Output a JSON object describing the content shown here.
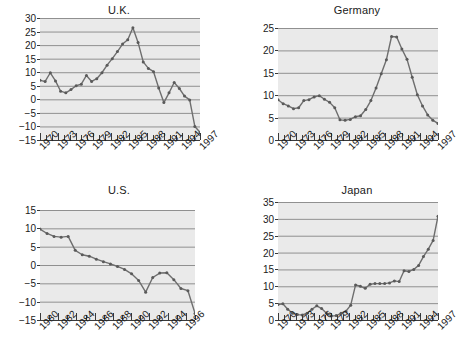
{
  "figure": {
    "panels_order": [
      "uk",
      "germany",
      "us",
      "japan"
    ]
  },
  "chart_data": [
    {
      "id": "uk",
      "type": "line",
      "title": "U.K.",
      "xlabel": "",
      "ylabel": "",
      "xlim": [
        1970,
        1997
      ],
      "ylim": [
        -15,
        30
      ],
      "yticks": [
        30,
        25,
        20,
        15,
        10,
        5,
        0,
        -5,
        -10,
        -15
      ],
      "xticks": [
        1970,
        1971,
        1972,
        1973,
        1974,
        1975,
        1976,
        1977,
        1978,
        1979,
        1980,
        1981,
        1982,
        1983,
        1984,
        1985,
        1986,
        1987,
        1988,
        1989,
        1990,
        1991,
        1992,
        1993,
        1994,
        1995,
        1996,
        1997
      ],
      "xticklabels": [
        "1970",
        "1973",
        "1976",
        "1979",
        "1982",
        "1985",
        "1988",
        "1991",
        "1994",
        "1997"
      ],
      "xticklabel_years": [
        1970,
        1973,
        1976,
        1979,
        1982,
        1985,
        1988,
        1991,
        1994,
        1997
      ],
      "grid": true,
      "markers": true,
      "x": [
        1970,
        1971,
        1972,
        1973,
        1974,
        1975,
        1976,
        1977,
        1978,
        1979,
        1980,
        1981,
        1982,
        1983,
        1984,
        1985,
        1986,
        1987,
        1988,
        1989,
        1990,
        1991,
        1992,
        1993,
        1994,
        1995,
        1996,
        1997
      ],
      "values": [
        7.0,
        6.6,
        9.8,
        6.8,
        3.0,
        2.4,
        3.6,
        5.0,
        5.6,
        8.8,
        6.6,
        7.6,
        9.8,
        12.6,
        15.0,
        17.6,
        20.4,
        22.0,
        26.4,
        21.0,
        13.8,
        11.4,
        10.2,
        4.2,
        -1.2,
        2.4,
        6.2,
        4.0,
        1.2,
        -0.2,
        -10.0,
        -12.2
      ]
    },
    {
      "id": "germany",
      "type": "line",
      "title": "Germany",
      "xlabel": "",
      "ylabel": "",
      "xlim": [
        1970,
        1997
      ],
      "ylim": [
        0,
        25
      ],
      "yticks": [
        25,
        20,
        15,
        10,
        5,
        0
      ],
      "xticks": [
        1970,
        1971,
        1972,
        1973,
        1974,
        1975,
        1976,
        1977,
        1978,
        1979,
        1980,
        1981,
        1982,
        1983,
        1984,
        1985,
        1986,
        1987,
        1988,
        1989,
        1990,
        1991,
        1992,
        1993,
        1994,
        1995,
        1996,
        1997
      ],
      "xticklabels": [
        "1970",
        "1973",
        "1976",
        "1979",
        "1982",
        "1985",
        "1988",
        "1991",
        "1994",
        "1997"
      ],
      "xticklabel_years": [
        1970,
        1973,
        1976,
        1979,
        1982,
        1985,
        1988,
        1991,
        1994,
        1997
      ],
      "grid": true,
      "markers": true,
      "x": [
        1970,
        1971,
        1972,
        1973,
        1974,
        1975,
        1976,
        1977,
        1978,
        1979,
        1980,
        1981,
        1982,
        1983,
        1984,
        1985,
        1986,
        1987,
        1988,
        1989,
        1990,
        1991,
        1992,
        1993,
        1994,
        1995,
        1996,
        1997
      ],
      "values": [
        9.0,
        8.1,
        7.6,
        7.0,
        7.2,
        8.8,
        9.0,
        9.6,
        9.9,
        9.1,
        8.4,
        7.2,
        4.5,
        4.4,
        4.6,
        5.2,
        5.4,
        6.8,
        8.8,
        11.6,
        14.8,
        17.9,
        23.1,
        23.0,
        20.3,
        18.0,
        14.0,
        10.1,
        7.6,
        5.6,
        4.4,
        3.7
      ]
    },
    {
      "id": "us",
      "type": "line",
      "title": "U.S.",
      "xlabel": "",
      "ylabel": "",
      "xlim": [
        1980,
        1997
      ],
      "ylim": [
        -15,
        15
      ],
      "yticks": [
        15,
        10,
        5,
        0,
        -5,
        -10,
        -15
      ],
      "xticks": [
        1980,
        1981,
        1982,
        1983,
        1984,
        1985,
        1986,
        1987,
        1988,
        1989,
        1990,
        1991,
        1992,
        1993,
        1994,
        1995,
        1996,
        1997
      ],
      "xticklabels": [
        "1980",
        "1982",
        "1984",
        "1986",
        "1988",
        "1990",
        "1992",
        "1994",
        "1996"
      ],
      "xticklabel_years": [
        1980,
        1982,
        1984,
        1986,
        1988,
        1990,
        1992,
        1994,
        1996
      ],
      "grid": true,
      "markers": true,
      "x": [
        1980,
        1981,
        1982,
        1983,
        1984,
        1985,
        1986,
        1987,
        1988,
        1989,
        1990,
        1991,
        1992,
        1993,
        1994,
        1995,
        1996,
        1997
      ],
      "values": [
        9.8,
        8.6,
        7.8,
        7.6,
        7.8,
        4.0,
        2.8,
        2.4,
        1.6,
        0.9,
        0.3,
        -0.4,
        -1.2,
        -2.4,
        -4.2,
        -7.4,
        -3.4,
        -2.2,
        -2.1,
        -4.0,
        -6.4,
        -7.0,
        -13.2
      ]
    },
    {
      "id": "japan",
      "type": "line",
      "title": "Japan",
      "xlabel": "",
      "ylabel": "",
      "xlim": [
        1970,
        1997
      ],
      "ylim": [
        0,
        35
      ],
      "yticks": [
        35,
        30,
        25,
        20,
        15,
        10,
        5,
        0
      ],
      "xticks": [
        1970,
        1971,
        1972,
        1973,
        1974,
        1975,
        1976,
        1977,
        1978,
        1979,
        1980,
        1981,
        1982,
        1983,
        1984,
        1985,
        1986,
        1987,
        1988,
        1989,
        1990,
        1991,
        1992,
        1993,
        1994,
        1995,
        1996,
        1997
      ],
      "xticklabels": [
        "1970",
        "1973",
        "1976",
        "1979",
        "1982",
        "1985",
        "1988",
        "1991",
        "1994",
        "1997"
      ],
      "xticklabel_years": [
        1970,
        1973,
        1976,
        1979,
        1982,
        1985,
        1988,
        1991,
        1994,
        1997
      ],
      "grid": true,
      "markers": true,
      "x": [
        1970,
        1971,
        1972,
        1973,
        1974,
        1975,
        1976,
        1977,
        1978,
        1979,
        1980,
        1981,
        1982,
        1983,
        1984,
        1985,
        1986,
        1987,
        1988,
        1989,
        1990,
        1991,
        1992,
        1993,
        1994,
        1995,
        1996,
        1997
      ],
      "values": [
        4.6,
        4.8,
        3.2,
        2.0,
        1.6,
        1.5,
        2.0,
        3.2,
        4.2,
        3.4,
        2.0,
        1.2,
        1.3,
        2.0,
        2.6,
        4.4,
        10.4,
        10.0,
        9.4,
        10.6,
        10.8,
        10.8,
        10.8,
        11.0,
        11.6,
        11.4,
        14.6,
        14.4,
        15.0,
        16.2,
        18.8,
        21.0,
        23.6,
        30.8
      ]
    }
  ],
  "style": {
    "plot_background": "#eaeaea",
    "grid_color": "#909090",
    "line_color": "#6e6e6e",
    "marker_color": "#5a5a5a",
    "axis_color": "#3a3a3a",
    "text_color": "#1a1a1a",
    "page_background": "#ffffff"
  }
}
